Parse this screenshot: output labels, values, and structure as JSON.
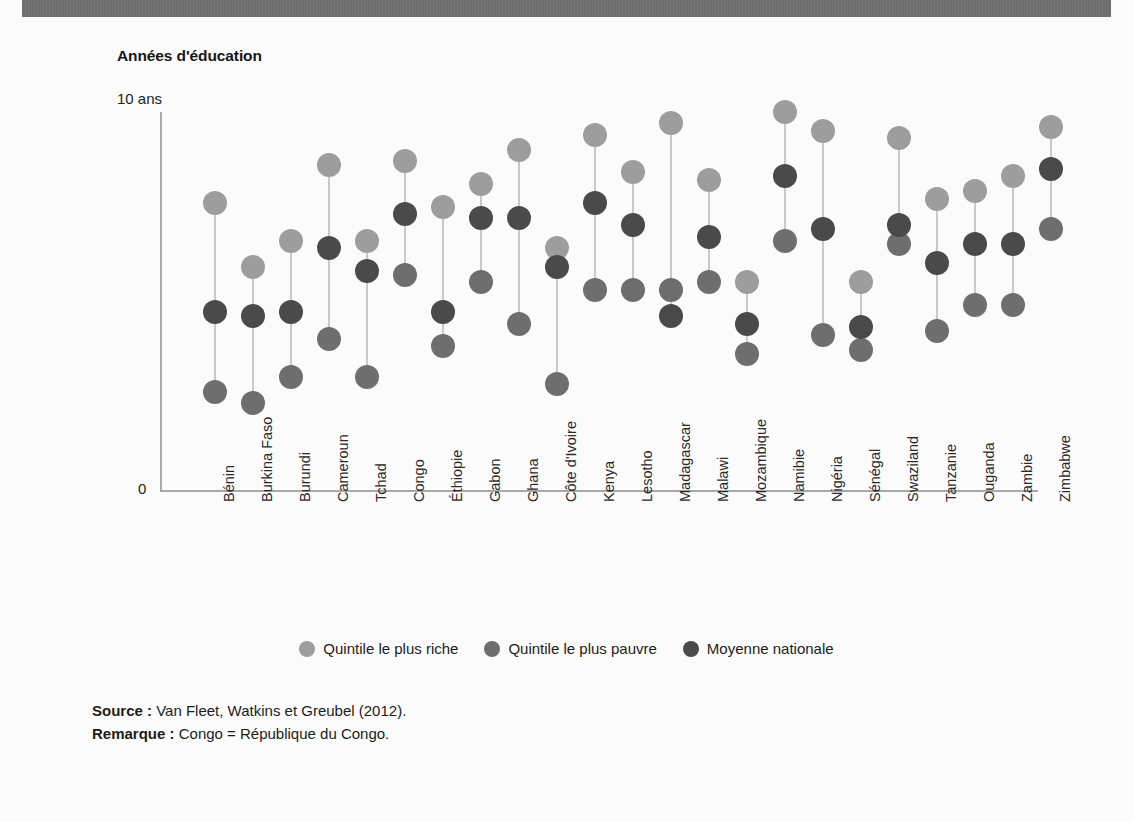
{
  "figure": {
    "title": "Années d'éducation",
    "axis": {
      "y_top_tick": "10 ans",
      "y_zero_tick": "0"
    }
  },
  "legend": {
    "position": "bottom-center",
    "items": [
      {
        "label": "Quintile le plus riche",
        "color": "#9d9d9d",
        "key": "richest"
      },
      {
        "label": "Quintile le plus pauvre",
        "color": "#6e6e6e",
        "key": "poorest"
      },
      {
        "label": "Moyenne nationale",
        "color": "#4a4a4a",
        "key": "national"
      }
    ]
  },
  "notes": {
    "source_label": "Source :",
    "source_text": "Van Fleet, Watkins et Greubel (2012).",
    "remark_label": "Remarque :",
    "remark_text": "Congo = République du Congo."
  },
  "colors": {
    "bar_gray": "#6f6f6f",
    "axis_gray": "#a8a8a8",
    "connector_gray": "#c9c9c9",
    "background": "#fbfbfb"
  },
  "chart_data": {
    "type": "scatter",
    "variant": "dumbbell-dot-plot",
    "title": "Années d'éducation",
    "xlabel": "",
    "ylabel": "Années d'éducation",
    "ylim": [
      0,
      10
    ],
    "yticks": [
      0,
      10
    ],
    "ytick_labels": [
      "0",
      "10 ans"
    ],
    "grid": false,
    "legend_position": "bottom-center",
    "categories": [
      "Bénin",
      "Burkina Faso",
      "Burundi",
      "Cameroun",
      "Tchad",
      "Congo",
      "Éthiopie",
      "Gabon",
      "Ghana",
      "Côte d'Ivoire",
      "Kenya",
      "Lesotho",
      "Madagascar",
      "Malawi",
      "Mozambique",
      "Namibie",
      "Nigéria",
      "Sénégal",
      "Swaziland",
      "Tanzanie",
      "Ouganda",
      "Zambie",
      "Zimbabwe"
    ],
    "series": [
      {
        "name": "Quintile le plus riche",
        "color": "#9d9d9d",
        "values": [
          7.6,
          5.9,
          6.6,
          8.6,
          6.6,
          8.7,
          7.5,
          8.1,
          9.0,
          6.4,
          9.4,
          8.4,
          9.7,
          8.2,
          5.5,
          10.0,
          9.5,
          5.5,
          9.3,
          7.7,
          7.9,
          8.3,
          9.6
        ]
      },
      {
        "name": "Quintile le plus pauvre",
        "color": "#6e6e6e",
        "values": [
          2.6,
          2.3,
          3.0,
          4.0,
          3.0,
          5.7,
          3.8,
          5.5,
          4.4,
          2.8,
          5.3,
          5.3,
          5.3,
          5.5,
          3.6,
          6.6,
          4.1,
          3.7,
          6.5,
          4.2,
          4.9,
          4.9,
          6.9
        ]
      },
      {
        "name": "Moyenne nationale",
        "color": "#4a4a4a",
        "values": [
          4.7,
          4.6,
          4.7,
          6.4,
          5.8,
          7.3,
          4.7,
          7.2,
          7.2,
          5.9,
          7.6,
          7.0,
          4.6,
          6.7,
          4.4,
          8.3,
          6.9,
          4.3,
          7.0,
          6.0,
          6.5,
          6.5,
          8.5
        ]
      }
    ]
  }
}
